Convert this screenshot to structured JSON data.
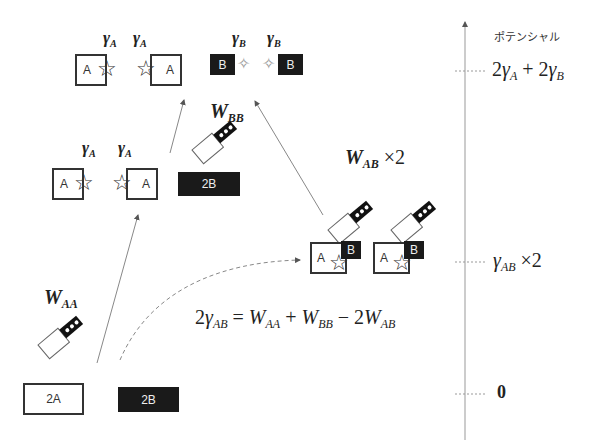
{
  "axis": {
    "title": "ポテンシャル",
    "levels": [
      {
        "id": "top",
        "label_html": "2γ_A + 2γ_B",
        "parts": [
          "2",
          "γ",
          "A",
          " + 2",
          "γ",
          "B"
        ]
      },
      {
        "id": "mid",
        "parts": [
          "γ",
          "AB",
          " ×2"
        ]
      },
      {
        "id": "zero",
        "label": "0"
      }
    ]
  },
  "states": {
    "top_left": {
      "gamma": "γ",
      "sub": "A",
      "block_label": "A"
    },
    "top_right": {
      "gamma": "γ",
      "sub": "B",
      "block_label": "B"
    },
    "middle_left": {
      "gamma": "γ",
      "sub": "A",
      "block_label": "A",
      "b_block": "2B"
    },
    "bottom": {
      "a_block": "2A",
      "b_block": "2B"
    },
    "right": {
      "a_label": "A",
      "b_label": "B"
    }
  },
  "work_labels": {
    "waa": {
      "w": "W",
      "sub": "AA"
    },
    "wbb": {
      "w": "W",
      "sub": "BB"
    },
    "wab": {
      "w": "W",
      "sub": "AB",
      "suffix": " ×2"
    }
  },
  "equation": {
    "lhs_coef": "2",
    "lhs_gamma": "γ",
    "lhs_sub": "AB",
    "eq": " = ",
    "t1": "W",
    "t1_sub": "AA",
    "plus": " + ",
    "t2": "W",
    "t2_sub": "BB",
    "minus": " − 2",
    "t3": "W",
    "t3_sub": "AB"
  },
  "colors": {
    "line": "#777777",
    "ink": "#222222",
    "black_block": "#1a1a1a"
  }
}
